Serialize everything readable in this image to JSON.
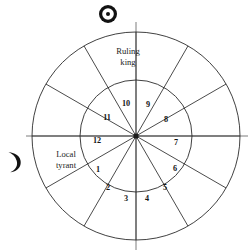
{
  "diagram": {
    "center": {
      "x": 136,
      "y": 136
    },
    "outer_radius": 104,
    "inner_radius": 56,
    "colors": {
      "line": "#2b2b2b",
      "axis": "#6e6e6e",
      "text": "#141414",
      "background": "#ffffff"
    },
    "symbols": [
      {
        "id": "sun",
        "name": "sun-symbol",
        "glyph": "☉",
        "position": "top",
        "x": 108,
        "y": 14
      },
      {
        "id": "moon",
        "name": "moon-symbol",
        "glyph": "☽",
        "position": "left",
        "x": 14,
        "y": 162
      }
    ],
    "sector_labels": [
      {
        "id": "ruling-king",
        "lines": [
          "Ruling",
          "king"
        ],
        "x": 128,
        "y": 52,
        "line_height": 11
      },
      {
        "id": "local-tyrant",
        "lines": [
          "Local",
          "tyrant"
        ],
        "x": 66,
        "y": 155,
        "line_height": 11
      }
    ],
    "inner_numbers": [
      {
        "label": "1",
        "angle_deg": 195,
        "x": 98,
        "y": 170
      },
      {
        "label": "2",
        "angle_deg": 225,
        "x": 108,
        "y": 188
      },
      {
        "label": "3",
        "angle_deg": 255,
        "x": 126,
        "y": 199
      },
      {
        "label": "4",
        "angle_deg": 285,
        "x": 147,
        "y": 199
      },
      {
        "label": "5",
        "angle_deg": 315,
        "x": 165,
        "y": 188
      },
      {
        "label": "6",
        "angle_deg": 345,
        "x": 175,
        "y": 169
      },
      {
        "label": "7",
        "angle_deg": 15,
        "x": 176,
        "y": 143
      },
      {
        "label": "8",
        "angle_deg": 45,
        "x": 166,
        "y": 120
      },
      {
        "label": "9",
        "angle_deg": 75,
        "x": 148,
        "y": 105
      },
      {
        "label": "10",
        "angle_deg": 105,
        "x": 126,
        "y": 104
      },
      {
        "label": "11",
        "angle_deg": 135,
        "x": 107,
        "y": 118
      },
      {
        "label": "12",
        "angle_deg": 165,
        "x": 97,
        "y": 141
      }
    ],
    "spoke_angles_deg": [
      0,
      30,
      60,
      90,
      120,
      150,
      180,
      210,
      240,
      270,
      300,
      330
    ],
    "axis_lines": [
      {
        "id": "vertical-axis",
        "x1": 136,
        "y1": 22,
        "x2": 136,
        "y2": 250
      },
      {
        "id": "horizontal-axis",
        "x1": 26,
        "y1": 136,
        "x2": 248,
        "y2": 136
      }
    ]
  }
}
